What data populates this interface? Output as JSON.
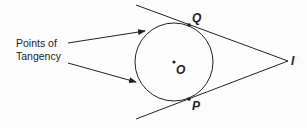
{
  "diagram": {
    "caption_line1": "Points of",
    "caption_line2": "Tangency",
    "labels": {
      "center": "O",
      "upper_tangent_point": "Q",
      "lower_tangent_point": "P",
      "external_point": "I"
    },
    "circle": {
      "cx": 174,
      "cy": 62,
      "r": 39
    },
    "points": {
      "O": [
        174,
        62
      ],
      "Q": [
        189,
        25
      ],
      "P": [
        189,
        99
      ],
      "I": [
        288,
        61
      ]
    },
    "colors": {
      "stroke": "#222222",
      "background": "#fdfdfd"
    }
  }
}
